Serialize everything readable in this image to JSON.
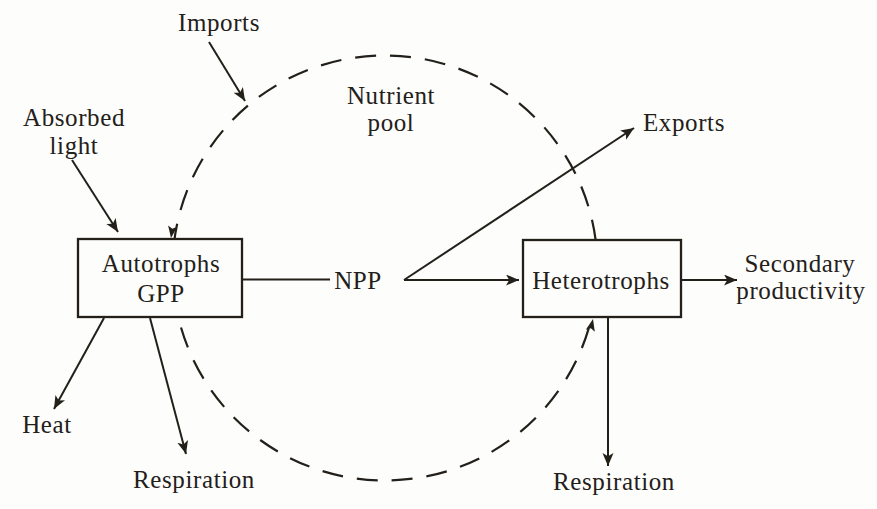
{
  "diagram": {
    "colors": {
      "ink": "#232019",
      "paper": "#fdfdfc"
    },
    "nodes": {
      "autotrophs": {
        "line1": "Autotrophs",
        "line2": "GPP"
      },
      "heterotrophs": {
        "label": "Heterotrophs"
      }
    },
    "pool": {
      "line1": "Nutrient",
      "line2": "pool"
    },
    "flows": {
      "imports": "Imports",
      "absorbed_light": {
        "line1": "Absorbed",
        "line2": "light"
      },
      "exports": "Exports",
      "heat": "Heat",
      "npp": "NPP",
      "autotroph_respiration": "Respiration",
      "heterotroph_respiration": "Respiration",
      "secondary_productivity": {
        "line1": "Secondary",
        "line2": "productivity"
      }
    }
  }
}
